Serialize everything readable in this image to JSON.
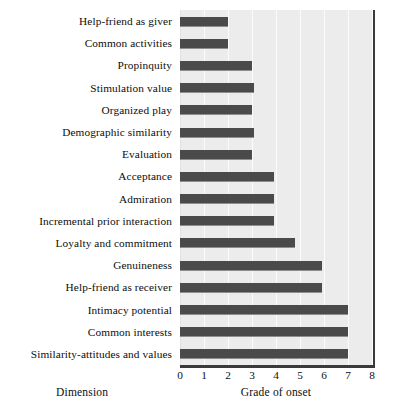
{
  "chart_data": {
    "type": "bar",
    "orientation": "horizontal",
    "title": "",
    "xlabel": "Grade of onset",
    "ylabel": "Dimension",
    "xlim": [
      0,
      8
    ],
    "ylim": null,
    "grid": true,
    "legend": null,
    "xticks": [
      "0",
      "1",
      "2",
      "3",
      "4",
      "5",
      "6",
      "7",
      "8"
    ],
    "categories": [
      "Help-friend as giver",
      "Common activities",
      "Propinquity",
      "Stimulation value",
      "Organized play",
      "Demographic similarity",
      "Evaluation",
      "Acceptance",
      "Admiration",
      "Incremental prior interaction",
      "Loyalty and commitment",
      "Genuineness",
      "Help-friend as receiver",
      "Intimacy potential",
      "Common interests",
      "Similarity-attitudes and values"
    ],
    "values": [
      2.0,
      2.0,
      3.0,
      3.1,
      3.0,
      3.1,
      3.0,
      3.9,
      3.9,
      3.9,
      4.8,
      5.9,
      5.9,
      7.0,
      7.0,
      7.0
    ],
    "bar_color": "#4a4a4a",
    "plot_background": "#ececec",
    "axis_color": "#3a3a3a"
  }
}
